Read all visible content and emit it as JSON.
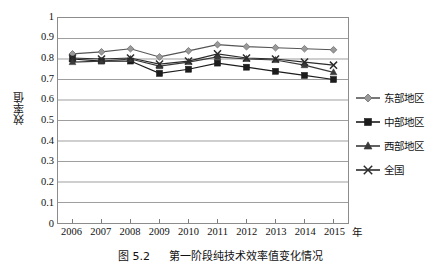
{
  "caption": {
    "figure_number": "图 5.2",
    "text": "第一阶段纯技术效率值变化情况"
  },
  "axes": {
    "ylabel": "效率值",
    "xlabel_unit": "年",
    "yticks": [
      "1",
      "0.9",
      "0.8",
      "0.7",
      "0.6",
      "0.5",
      "0.4",
      "0.3",
      "0.2",
      "0.1",
      "0"
    ],
    "xticks": [
      "2006",
      "2007",
      "2008",
      "2009",
      "2010",
      "2011",
      "2012",
      "2013",
      "2014",
      "2015"
    ]
  },
  "legend": {
    "items": [
      {
        "label": "东部地区",
        "marker": "diamond-marker-icon",
        "color": "#9a9a9a"
      },
      {
        "label": "中部地区",
        "marker": "square-marker-icon",
        "color": "#1c1c1c"
      },
      {
        "label": "西部地区",
        "marker": "triangle-marker-icon",
        "color": "#3a3a3a"
      },
      {
        "label": "全国",
        "marker": "cross-marker-icon",
        "color": "#2b2b2b"
      }
    ]
  },
  "chart_data": {
    "type": "line",
    "title": "第一阶段纯技术效率值变化情况",
    "xlabel": "年",
    "ylabel": "效率值",
    "x": [
      2006,
      2007,
      2008,
      2009,
      2010,
      2011,
      2012,
      2013,
      2014,
      2015
    ],
    "categories": [
      "2006",
      "2007",
      "2008",
      "2009",
      "2010",
      "2011",
      "2012",
      "2013",
      "2014",
      "2015"
    ],
    "ylim": [
      0,
      1
    ],
    "ytick_step": 0.1,
    "grid": "horizontal",
    "legend_position": "right",
    "series": [
      {
        "name": "东部地区",
        "marker": "diamond",
        "color": "#9a9a9a",
        "values": [
          0.825,
          0.835,
          0.85,
          0.81,
          0.84,
          0.87,
          0.86,
          0.855,
          0.85,
          0.845
        ]
      },
      {
        "name": "中部地区",
        "marker": "square",
        "color": "#1c1c1c",
        "values": [
          0.8,
          0.79,
          0.79,
          0.73,
          0.75,
          0.78,
          0.76,
          0.74,
          0.72,
          0.7
        ]
      },
      {
        "name": "西部地区",
        "marker": "triangle",
        "color": "#3a3a3a",
        "values": [
          0.785,
          0.79,
          0.8,
          0.765,
          0.785,
          0.81,
          0.8,
          0.795,
          0.77,
          0.735
        ]
      },
      {
        "name": "全国",
        "marker": "cross",
        "color": "#2b2b2b",
        "values": [
          0.805,
          0.8,
          0.805,
          0.775,
          0.79,
          0.825,
          0.805,
          0.8,
          0.785,
          0.77
        ]
      }
    ]
  },
  "style": {
    "grid_color": "#9d9d9d",
    "border_color": "#8c8c8c",
    "background": "#ffffff",
    "text_color": "#111111"
  }
}
